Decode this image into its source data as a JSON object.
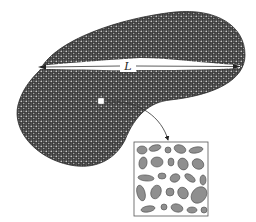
{
  "diagram": {
    "type": "granular-body-with-magnified-inset",
    "body": {
      "shape": "kidney / bean blob",
      "texture": "dense granular packing",
      "fill_color": "#3a3a3a",
      "grain_color": "#bdbdbd"
    },
    "dimension_arrow": {
      "label": "L",
      "meaning": "characteristic length of the body",
      "direction": "horizontal, double-headed",
      "color": "#ffffff"
    },
    "sample_marker": {
      "shape": "small square",
      "color": "#ffffff"
    },
    "pointer_arrow": {
      "shape": "curved",
      "from": "sample_marker",
      "to": "inset"
    },
    "inset": {
      "title": "magnified sample",
      "content": "ellipsoidal grains of varied size and orientation",
      "border_color": "#555555",
      "grain_fill": "#8f8f8f",
      "grain_stroke": "#4a4a4a"
    }
  }
}
